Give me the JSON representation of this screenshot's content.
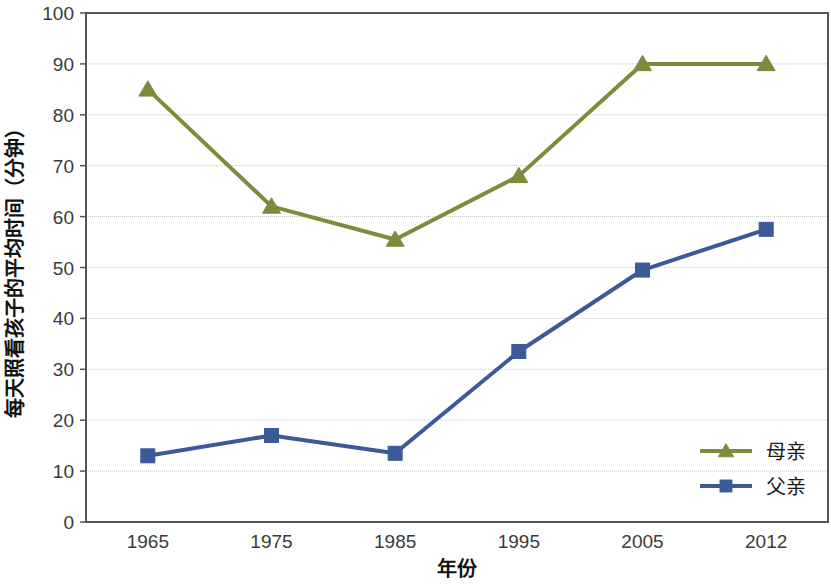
{
  "chart_data": {
    "type": "line",
    "title": "",
    "xlabel": "年份",
    "ylabel": "每天照看孩子的平均时间（分钟）",
    "categories": [
      "1965",
      "1975",
      "1985",
      "1995",
      "2005",
      "2012"
    ],
    "series": [
      {
        "name": "母亲",
        "color": "#7d8c3c",
        "marker": "triangle",
        "values": [
          85,
          62,
          55.5,
          68,
          90,
          90
        ]
      },
      {
        "name": "父亲",
        "color": "#3c5a96",
        "marker": "square",
        "values": [
          13,
          17,
          13.5,
          33.5,
          49.5,
          57.5
        ]
      }
    ],
    "ylim": [
      0,
      100
    ],
    "yticks": [
      0,
      10,
      20,
      30,
      40,
      50,
      60,
      70,
      80,
      90,
      100
    ],
    "ytick_labels": [
      "0",
      "10",
      "20",
      "30",
      "40",
      "50",
      "60",
      "70",
      "80",
      "90",
      "100"
    ],
    "grid": true,
    "grid_axis": "y",
    "grid_color": "#c8c8c8",
    "legend_position": "bottom-right",
    "plot_border_color": "#555555",
    "background": "#ffffff"
  },
  "axes": {
    "x_title": "年份",
    "y_title": "每天照看孩子的平均时间（分钟）"
  },
  "legend": {
    "items": [
      {
        "label": "母亲",
        "color": "#7d8c3c",
        "marker": "triangle"
      },
      {
        "label": "父亲",
        "color": "#3c5a96",
        "marker": "square"
      }
    ]
  }
}
